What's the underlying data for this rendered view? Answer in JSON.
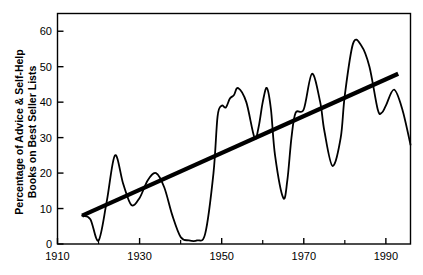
{
  "chart_data": {
    "type": "line",
    "title": "",
    "subtitle": "",
    "xlabel": "",
    "ylabel": "Percentage of Advice & Self-Help Books on Best Seller Lists",
    "ylabel_line1": "Percentage of Advice & Self-Help",
    "ylabel_line2": "Books on Best Seller Lists",
    "xlim": [
      1910,
      1996
    ],
    "ylim": [
      0,
      65
    ],
    "xticks": [
      1910,
      1930,
      1950,
      1970,
      1990
    ],
    "xtick_labels": [
      "1910",
      "1930",
      "1950",
      "1970",
      "1990"
    ],
    "xminor_ticks": [
      1920,
      1940,
      1960,
      1980
    ],
    "yticks": [
      0,
      10,
      20,
      30,
      40,
      50,
      60
    ],
    "ytick_labels": [
      "0",
      "10",
      "20",
      "30",
      "40",
      "50",
      "60"
    ],
    "grid": false,
    "legend": null,
    "legend_position": "none",
    "frame": "box",
    "line_color": "#000000",
    "trend_color": "#000000",
    "background_color": "#ffffff",
    "series": [
      {
        "name": "Percentage of advice & self-help books on best seller lists",
        "type": "line",
        "line_width": 1.8,
        "x": [
          1916,
          1918,
          1920,
          1922,
          1924,
          1926,
          1928,
          1930,
          1932,
          1934,
          1936,
          1938,
          1940,
          1942,
          1944,
          1946,
          1948,
          1949,
          1950,
          1951,
          1952,
          1953,
          1954,
          1956,
          1958,
          1959,
          1960,
          1961,
          1962,
          1963,
          1965,
          1966,
          1967,
          1968,
          1970,
          1972,
          1974,
          1975,
          1977,
          1979,
          1980,
          1982,
          1984,
          1986,
          1988,
          1989,
          1990,
          1992,
          1994,
          1996
        ],
        "y": [
          8.0,
          7.0,
          1.0,
          12.0,
          25.0,
          17.0,
          11.0,
          13.0,
          18.0,
          20.0,
          16.0,
          8.0,
          2.0,
          1.0,
          1.0,
          3.0,
          20.0,
          36.0,
          39.0,
          38.5,
          41.0,
          42.0,
          44.0,
          40.0,
          30.0,
          33.0,
          40.0,
          44.0,
          38.0,
          25.0,
          13.0,
          18.0,
          30.0,
          37.0,
          38.0,
          48.0,
          40.0,
          32.0,
          22.0,
          30.0,
          42.0,
          56.5,
          56.0,
          50.0,
          38.0,
          37.0,
          39.0,
          43.5,
          38.0,
          28.0
        ]
      },
      {
        "name": "Linear trend line",
        "type": "trend",
        "line_width": 4.2,
        "x": [
          1916,
          1993
        ],
        "y": [
          8.0,
          48.0
        ]
      }
    ]
  },
  "axes": {
    "y_title_line1": "Percentage of Advice & Self-Help",
    "y_title_line2": "Books on Best Seller Lists"
  }
}
